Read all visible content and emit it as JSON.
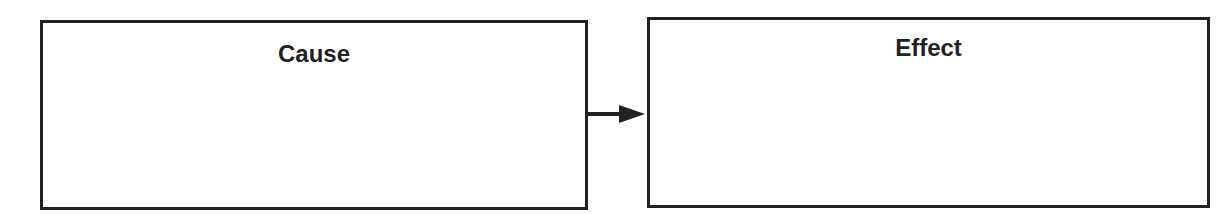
{
  "diagram": {
    "type": "cause-effect",
    "boxes": [
      {
        "id": "cause",
        "title": "Cause",
        "content": ""
      },
      {
        "id": "effect",
        "title": "Effect",
        "content": ""
      }
    ],
    "connectors": [
      {
        "from": "cause",
        "to": "effect",
        "style": "arrow"
      }
    ],
    "colors": {
      "stroke": "#222222",
      "background": "#ffffff"
    }
  }
}
